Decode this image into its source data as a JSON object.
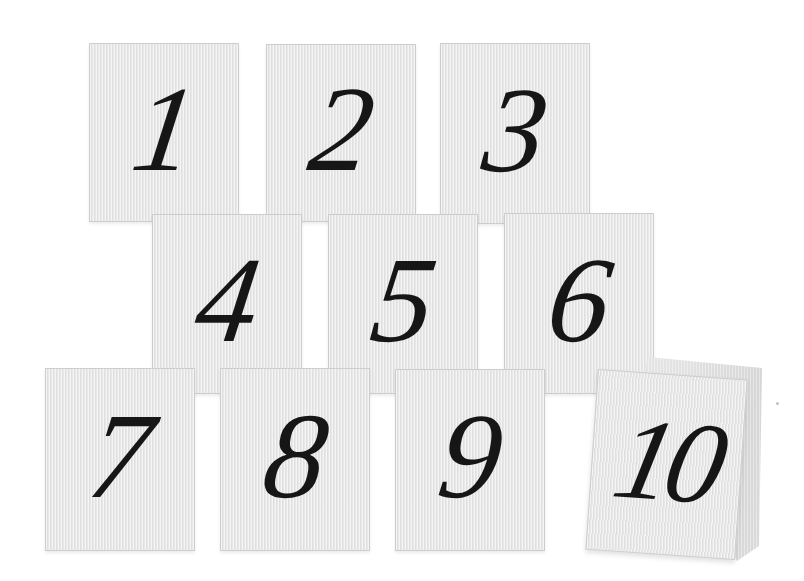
{
  "colors": {
    "background": "#ffffff",
    "card_fill": "#e8e8e8",
    "card_border": "#cdcdcd",
    "digit": "#161616",
    "tent_back_fill": "#dcdcdc"
  },
  "cards": [
    {
      "number": "1",
      "folded": false
    },
    {
      "number": "2",
      "folded": false
    },
    {
      "number": "3",
      "folded": false
    },
    {
      "number": "4",
      "folded": false
    },
    {
      "number": "5",
      "folded": false
    },
    {
      "number": "6",
      "folded": false
    },
    {
      "number": "7",
      "folded": false
    },
    {
      "number": "8",
      "folded": false
    },
    {
      "number": "9",
      "folded": false
    },
    {
      "number": "10",
      "folded": true
    }
  ]
}
